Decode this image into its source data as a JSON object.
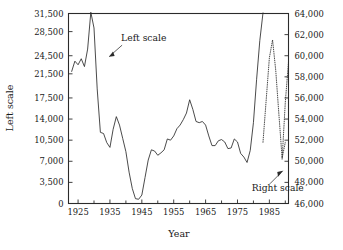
{
  "chart_data": {
    "type": "line",
    "title": "",
    "subtitle": "",
    "xlabel": "Year",
    "ylabel": "Left scale",
    "ylabel_right": "",
    "grid": false,
    "legend_position": "none",
    "xlim": [
      1922,
      1991
    ],
    "xticks": [
      1925,
      1935,
      1945,
      1955,
      1965,
      1975,
      1985
    ],
    "xtick_labels": [
      "1925",
      "1935",
      "1945",
      "1955",
      "1965",
      "1975",
      "1985"
    ],
    "xminor_ticks": [
      1930,
      1940,
      1950,
      1960,
      1970,
      1980,
      1990
    ],
    "ylim_left": [
      0,
      31500
    ],
    "yticks_left": [
      0,
      3500,
      7000,
      10500,
      14000,
      17500,
      21500,
      24500,
      28500,
      31500
    ],
    "ytick_labels_left": [
      "0",
      "3,500",
      "7,000",
      "10,500",
      "14,000",
      "17,500",
      "21,500",
      "24,500",
      "28,500",
      "31,500"
    ],
    "ylim_right": [
      46000,
      64000
    ],
    "yticks_right": [
      46000,
      48000,
      50000,
      52000,
      54000,
      56000,
      58000,
      60000,
      62000,
      64000
    ],
    "ytick_labels_right": [
      "46,000",
      "48,000",
      "50,000",
      "52,000",
      "54,000",
      "56,000",
      "58,000",
      "60,000",
      "62,000",
      "64,000"
    ],
    "annotations": [
      {
        "text": "Left scale",
        "x": 1938.5,
        "y_axis": "left",
        "y": 27000
      },
      {
        "text": "Right scale",
        "x": 1979.5,
        "y_axis": "right",
        "y": 47200
      }
    ],
    "series": [
      {
        "name": "Left scale",
        "axis": "left",
        "style": "solid",
        "x": [
          1923,
          1924,
          1925,
          1926,
          1927,
          1928,
          1929,
          1930,
          1931,
          1932,
          1933,
          1934,
          1935,
          1936,
          1937,
          1938,
          1939,
          1940,
          1941,
          1942,
          1943,
          1944,
          1945,
          1946,
          1947,
          1948,
          1949,
          1950,
          1951,
          1952,
          1953,
          1954,
          1955,
          1956,
          1957,
          1958,
          1959,
          1960,
          1961,
          1962,
          1963,
          1964,
          1965,
          1966,
          1967,
          1968,
          1969,
          1970,
          1971,
          1972,
          1973,
          1974,
          1975,
          1976,
          1977,
          1978,
          1979,
          1980,
          1981,
          1982,
          1983
        ],
        "y": [
          21900,
          23600,
          23000,
          24000,
          22700,
          25600,
          31700,
          29100,
          19000,
          11800,
          11600,
          10100,
          9300,
          12300,
          14400,
          13000,
          10800,
          8600,
          5200,
          2500,
          800,
          700,
          1400,
          4300,
          7200,
          8900,
          8700,
          8000,
          8400,
          8900,
          10700,
          10500,
          11200,
          12400,
          13000,
          13900,
          15000,
          17200,
          15600,
          13600,
          13400,
          13600,
          13000,
          11200,
          9600,
          9600,
          10400,
          10600,
          10200,
          9100,
          9200,
          10700,
          10200,
          8300,
          7700,
          6800,
          8800,
          13400,
          20600,
          27000,
          31600
        ]
      },
      {
        "name": "Right scale",
        "axis": "right",
        "style": "dotted",
        "x": [
          1983,
          1984,
          1985,
          1986,
          1987,
          1988,
          1989,
          1990
        ],
        "y": [
          51800,
          55800,
          59800,
          61500,
          58600,
          54400,
          50300,
          51800
        ]
      },
      {
        "name": "Right scale continuation",
        "axis": "right",
        "style": "dotted",
        "x": [
          1989,
          1990,
          1991
        ],
        "y": [
          50200,
          55600,
          59400
        ]
      }
    ]
  },
  "labels": {
    "x_axis_title": "Year",
    "y_axis_title": "Left scale",
    "annotation_left": "Left scale",
    "annotation_right": "Right scale"
  },
  "colors": {
    "ink": "#2b2b2b",
    "background": "#ffffff"
  }
}
